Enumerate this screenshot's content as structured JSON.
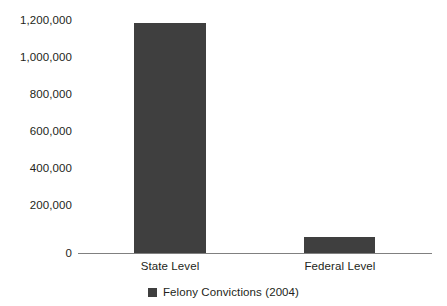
{
  "chart_data": {
    "type": "bar",
    "title": "",
    "subtitle": "",
    "xlabel": "",
    "ylabel": "",
    "categories": [
      "State Level",
      "Federal Level"
    ],
    "values": [
      1090000,
      77000
    ],
    "series": [
      {
        "name": "Felony Convictions (2004)",
        "values": [
          1090000,
          77000
        ],
        "color": "#3f3f3f"
      }
    ],
    "ylim": [
      0,
      1200000
    ],
    "yticks": [
      0,
      200000,
      400000,
      600000,
      800000,
      1000000,
      1200000
    ],
    "ytick_labels": [
      "0",
      "200,000",
      "400,000",
      "600,000",
      "800,000",
      "1,000,000",
      "1,200,000"
    ],
    "grid": false,
    "legend": {
      "position": "bottom-center",
      "entries": [
        {
          "label": "Felony Convictions (2004)",
          "color": "#3f3f3f",
          "marker": "square-swatch"
        }
      ]
    },
    "axis": {
      "baseline_color": "#808080",
      "y_axis_line": false
    },
    "background_color": "#ffffff"
  }
}
